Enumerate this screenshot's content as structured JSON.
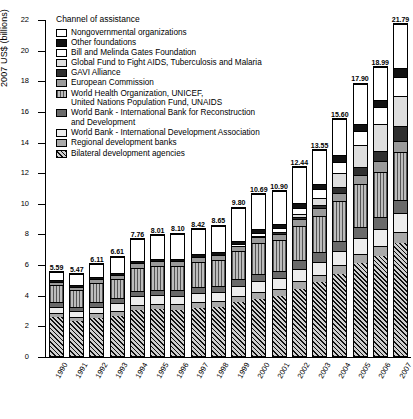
{
  "chart_data": {
    "type": "bar",
    "subtype": "stacked-bar",
    "title": "",
    "xlabel": "",
    "ylabel": "2007 US$ (billions)",
    "ylim": [
      0,
      22
    ],
    "ytick_values": [
      0,
      2,
      4,
      6,
      8,
      10,
      12,
      14,
      16,
      18,
      20,
      22
    ],
    "grid": false,
    "legend_position": "upper-left-inside",
    "legend_title": "Channel of assistance",
    "categories": [
      "1990",
      "1991",
      "1992",
      "1993",
      "1994",
      "1995",
      "1996",
      "1997",
      "1998",
      "1999",
      "2000",
      "2001",
      "2002",
      "2003",
      "2004",
      "2005",
      "2006",
      "2007"
    ],
    "totals": [
      5.59,
      5.47,
      6.11,
      6.61,
      7.76,
      8.01,
      8.1,
      8.42,
      8.65,
      9.8,
      10.69,
      10.9,
      12.44,
      13.55,
      15.6,
      17.9,
      18.99,
      21.79
    ],
    "total_labels": [
      "5.59",
      "5.47",
      "6.11",
      "6.61",
      "7.76",
      "8.01",
      "8.10",
      "8.42",
      "8.65",
      "9.80",
      "10.69",
      "10.90",
      "12.44",
      "13.55",
      "15.60",
      "17.90",
      "18.99",
      "21.79"
    ],
    "series": [
      {
        "name": "Bilateral development agencies",
        "pattern": "diagonal-hatch",
        "values": [
          2.6,
          2.35,
          2.55,
          2.7,
          3.05,
          3.1,
          3.05,
          3.2,
          3.25,
          3.55,
          3.8,
          3.95,
          4.45,
          4.85,
          5.4,
          6.1,
          6.6,
          7.45
        ]
      },
      {
        "name": "Regional development banks",
        "pattern": "solid-medium-gray",
        "values": [
          0.28,
          0.26,
          0.3,
          0.32,
          0.36,
          0.36,
          0.37,
          0.38,
          0.39,
          0.42,
          0.45,
          0.46,
          0.5,
          0.52,
          0.58,
          0.62,
          0.66,
          0.72
        ]
      },
      {
        "name": "World Bank - International Development Association",
        "pattern": "solid-pale-gray",
        "values": [
          0.42,
          0.4,
          0.45,
          0.48,
          0.55,
          0.56,
          0.57,
          0.58,
          0.6,
          0.66,
          0.7,
          0.72,
          0.8,
          0.86,
          0.95,
          1.05,
          1.12,
          1.22
        ]
      },
      {
        "name": "World Bank - International Bank for Reconstruction and Development",
        "pattern": "solid-dark-gray",
        "values": [
          0.3,
          0.28,
          0.32,
          0.34,
          0.39,
          0.39,
          0.4,
          0.41,
          0.42,
          0.46,
          0.49,
          0.5,
          0.56,
          0.6,
          0.66,
          0.73,
          0.78,
          0.85
        ]
      },
      {
        "name": "World Health Organization, UNICEF, United Nations Population Fund, UNAIDS",
        "pattern": "vertical-stripes",
        "values": [
          1.15,
          1.12,
          1.25,
          1.32,
          1.52,
          1.58,
          1.6,
          1.66,
          1.7,
          1.85,
          2.0,
          2.05,
          2.25,
          2.4,
          2.6,
          2.8,
          2.95,
          3.15
        ]
      },
      {
        "name": "European Commission",
        "pattern": "solid-gray-medium",
        "values": [
          0.22,
          0.21,
          0.24,
          0.26,
          0.3,
          0.31,
          0.31,
          0.33,
          0.34,
          0.37,
          0.4,
          0.41,
          0.46,
          0.5,
          0.56,
          0.62,
          0.68,
          0.74
        ]
      },
      {
        "name": "GAVI Alliance",
        "pattern": "solid-very-dark",
        "values": [
          0.0,
          0.0,
          0.0,
          0.0,
          0.0,
          0.0,
          0.0,
          0.0,
          0.0,
          0.0,
          0.08,
          0.12,
          0.18,
          0.25,
          0.35,
          0.5,
          0.7,
          0.95
        ]
      },
      {
        "name": "Global Fund to Fight AIDS, Tuberculosis and Malaria",
        "pattern": "solid-light-gray",
        "values": [
          0.0,
          0.0,
          0.0,
          0.0,
          0.0,
          0.0,
          0.0,
          0.0,
          0.0,
          0.0,
          0.0,
          0.0,
          0.15,
          0.45,
          0.95,
          1.45,
          1.75,
          2.0
        ]
      },
      {
        "name": "Bill and Melinda Gates Foundation",
        "pattern": "white-fill",
        "values": [
          0.0,
          0.0,
          0.0,
          0.0,
          0.0,
          0.0,
          0.0,
          0.0,
          0.0,
          0.08,
          0.2,
          0.28,
          0.42,
          0.55,
          0.75,
          0.95,
          1.1,
          1.25
        ]
      },
      {
        "name": "Other foundations",
        "pattern": "black-fill",
        "values": [
          0.12,
          0.11,
          0.13,
          0.14,
          0.16,
          0.17,
          0.17,
          0.18,
          0.19,
          0.22,
          0.25,
          0.26,
          0.3,
          0.34,
          0.4,
          0.46,
          0.52,
          0.58
        ]
      },
      {
        "name": "Nongovernmental organizations",
        "pattern": "fine-dotted",
        "values": [
          0.5,
          0.74,
          0.87,
          1.05,
          1.43,
          1.54,
          1.63,
          1.68,
          1.76,
          2.19,
          2.32,
          2.15,
          2.37,
          2.23,
          2.4,
          2.62,
          2.13,
          2.88
        ]
      }
    ]
  },
  "legend": {
    "title": "Channel of assistance",
    "items": [
      {
        "label": "Nongovernmental organizations",
        "label2": "",
        "swatch": "p-dots-lt"
      },
      {
        "label": "Other foundations",
        "label2": "",
        "swatch": "p-black"
      },
      {
        "label": "Bill and Melinda Gates Foundation",
        "label2": "",
        "swatch": "p-white"
      },
      {
        "label": "Global Fund to Fight AIDS, Tuberculosis and Malaria",
        "label2": "",
        "swatch": "p-gray-lt"
      },
      {
        "label": "GAVI Alliance",
        "label2": "",
        "swatch": "p-darkgray"
      },
      {
        "label": "European Commission",
        "label2": "",
        "swatch": "p-gray-md"
      },
      {
        "label": "World Health Organization, UNICEF,",
        "label2": "United Nations Population Fund, UNAIDS",
        "swatch": "p-vstripe"
      },
      {
        "label": "World Bank - International Bank for Reconstruction",
        "label2": "and Development",
        "swatch": "p-gray-dk"
      },
      {
        "label": "World Bank - International Development Association",
        "label2": "",
        "swatch": "p-gray-pale"
      },
      {
        "label": "Regional development banks",
        "label2": "",
        "swatch": "p-gray-med2"
      },
      {
        "label": "Bilateral development agencies",
        "label2": "",
        "swatch": "p-diag"
      }
    ]
  }
}
